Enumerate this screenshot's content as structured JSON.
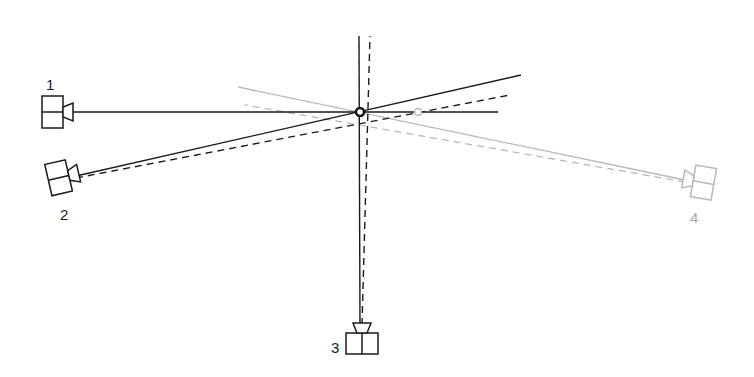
{
  "diagram": {
    "type": "multi-camera triangulation",
    "colors": {
      "primary": "#1a1a1a",
      "secondary": "#b8b8b8",
      "background": "#ffffff"
    },
    "cameras": [
      {
        "id": "1",
        "label": "1",
        "x": 52,
        "y": 112,
        "angle": 0,
        "color": "primary",
        "label_x": 46,
        "label_y": 90
      },
      {
        "id": "2",
        "label": "2",
        "x": 62,
        "y": 177,
        "angle": -13,
        "color": "primary",
        "label_x": 66,
        "label_y": 220
      },
      {
        "id": "3",
        "label": "3",
        "x": 362,
        "y": 342,
        "angle": -90,
        "color": "primary",
        "label_x": 336,
        "label_y": 352
      },
      {
        "id": "4",
        "label": "4",
        "x": 700,
        "y": 182,
        "angle": 190,
        "color": "secondary",
        "label_x": 694,
        "label_y": 222
      }
    ],
    "points": [
      {
        "name": "estimated-intersection",
        "x": 360,
        "y": 112,
        "color": "primary"
      },
      {
        "name": "projected-point",
        "x": 418,
        "y": 112,
        "color": "secondary"
      }
    ]
  }
}
